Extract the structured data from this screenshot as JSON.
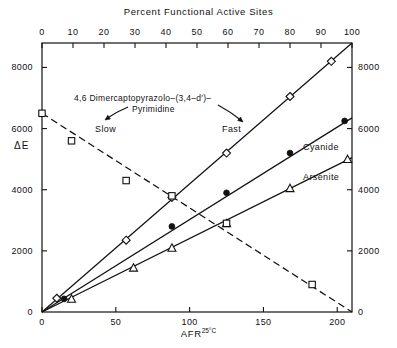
{
  "chart_data": {
    "type": "scatter",
    "title": "",
    "top_axis": {
      "label": "Percent Functional Active Sites",
      "ticks": [
        0,
        10,
        20,
        30,
        40,
        50,
        60,
        70,
        80,
        90,
        100
      ],
      "range": [
        0,
        100
      ]
    },
    "xlabel": "AFR",
    "xlabel_superscript": "25°C",
    "x_ticks": [
      0,
      50,
      100,
      150,
      200
    ],
    "xlim": [
      0,
      210
    ],
    "ylabel": "ΔE",
    "y_ticks": [
      0,
      2000,
      4000,
      6000,
      8000
    ],
    "ylim": [
      0,
      8800
    ],
    "right_axis": {
      "ticks": [
        0,
        2000,
        4000,
        6000,
        8000
      ],
      "range": [
        0,
        8800
      ]
    },
    "grid": false,
    "legend_position": "inline-right",
    "series": [
      {
        "name": "Pyrazolopyrimidine",
        "marker": "open-diamond",
        "line": "solid",
        "label": "",
        "points": [
          {
            "x": 10,
            "y": 450
          },
          {
            "x": 57,
            "y": 2350
          },
          {
            "x": 88,
            "y": 3750
          },
          {
            "x": 125,
            "y": 5200
          },
          {
            "x": 168,
            "y": 7050
          },
          {
            "x": 196,
            "y": 8200
          }
        ],
        "fit_from": {
          "x": 0,
          "y": 0
        },
        "fit_to": {
          "x": 210,
          "y": 8800
        }
      },
      {
        "name": "Cyanide",
        "marker": "filled-circle",
        "line": "solid",
        "label": "Cyanide",
        "points": [
          {
            "x": 15,
            "y": 430
          },
          {
            "x": 88,
            "y": 2800
          },
          {
            "x": 125,
            "y": 3900
          },
          {
            "x": 168,
            "y": 5200
          },
          {
            "x": 205,
            "y": 6250
          }
        ],
        "fit_from": {
          "x": 0,
          "y": 0
        },
        "fit_to": {
          "x": 210,
          "y": 6350
        }
      },
      {
        "name": "Arsenite",
        "marker": "open-triangle",
        "line": "solid",
        "label": "Arsenite",
        "points": [
          {
            "x": 20,
            "y": 430
          },
          {
            "x": 62,
            "y": 1450
          },
          {
            "x": 88,
            "y": 2100
          },
          {
            "x": 125,
            "y": 2900
          },
          {
            "x": 168,
            "y": 4050
          },
          {
            "x": 207,
            "y": 5000
          }
        ],
        "fit_from": {
          "x": 0,
          "y": 0
        },
        "fit_to": {
          "x": 210,
          "y": 5050
        }
      },
      {
        "name": "Slow inactivation",
        "marker": "open-square",
        "line": "dashed",
        "label": "",
        "points": [
          {
            "x": 0,
            "y": 6500
          },
          {
            "x": 20,
            "y": 5600
          },
          {
            "x": 57,
            "y": 4300
          },
          {
            "x": 88,
            "y": 3800
          },
          {
            "x": 125,
            "y": 2900
          },
          {
            "x": 183,
            "y": 900
          }
        ],
        "fit_from": {
          "x": 0,
          "y": 6500
        },
        "fit_to": {
          "x": 210,
          "y": 0
        }
      }
    ],
    "annotations": [
      {
        "id": "compound-name-line1",
        "text": "4,6 Dimercaptopyrazolo–(3,4–d′)–"
      },
      {
        "id": "compound-name-line2",
        "text": "Pyrimidine"
      },
      {
        "id": "rate-slow",
        "text": "Slow"
      },
      {
        "id": "rate-fast",
        "text": "Fast"
      }
    ],
    "colors": {
      "axis": "#111111",
      "marker": "#111111",
      "line": "#111111",
      "background": "#ffffff"
    }
  }
}
